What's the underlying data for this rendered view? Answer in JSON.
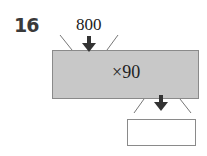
{
  "question": {
    "number": "16"
  },
  "machine": {
    "input": "800",
    "operation": "×90",
    "output": "",
    "fill_color": "#c8c8c8",
    "border_color": "#8a8a8a",
    "arrow_color": "#333333"
  },
  "icons": {
    "input_arrow": "arrow-down-icon",
    "output_arrow": "arrow-down-icon"
  }
}
